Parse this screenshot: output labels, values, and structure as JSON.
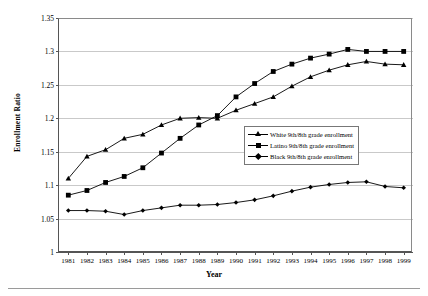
{
  "chart_data": {
    "type": "line",
    "title": "",
    "xlabel": "Year",
    "ylabel": "Enrollment Ratio",
    "x": [
      1981,
      1982,
      1983,
      1984,
      1985,
      1986,
      1987,
      1988,
      1989,
      1990,
      1991,
      1992,
      1993,
      1994,
      1995,
      1996,
      1997,
      1998,
      1999
    ],
    "categories": [
      "1981",
      "1982",
      "1983",
      "1984",
      "1985",
      "1986",
      "1987",
      "1988",
      "1989",
      "1990",
      "1991",
      "1992",
      "1993",
      "1994",
      "1995",
      "1996",
      "1997",
      "1998",
      "1999"
    ],
    "ylim": [
      1,
      1.35
    ],
    "ytick_labels": [
      "1",
      "1.05",
      "1.1",
      "1.15",
      "1.2",
      "1.25",
      "1.3",
      "1.35"
    ],
    "ytick_values": [
      1,
      1.05,
      1.1,
      1.15,
      1.2,
      1.25,
      1.3,
      1.35
    ],
    "grid": true,
    "legend_position": "center-right",
    "series": [
      {
        "name": "White 9th/8th grade enrollment",
        "marker": "triangle",
        "values": [
          1.11,
          1.143,
          1.153,
          1.17,
          1.176,
          1.19,
          1.2,
          1.201,
          1.2,
          1.212,
          1.222,
          1.232,
          1.248,
          1.262,
          1.272,
          1.28,
          1.285,
          1.281,
          1.28
        ]
      },
      {
        "name": "Latino 9th/8th grade enrollment",
        "marker": "square",
        "values": [
          1.085,
          1.092,
          1.104,
          1.113,
          1.126,
          1.148,
          1.17,
          1.19,
          1.204,
          1.232,
          1.252,
          1.27,
          1.281,
          1.29,
          1.296,
          1.303,
          1.3,
          1.3,
          1.3
        ]
      },
      {
        "name": "Black 9th/8th grade enrollment",
        "marker": "diamond",
        "values": [
          1.062,
          1.062,
          1.061,
          1.056,
          1.062,
          1.066,
          1.07,
          1.07,
          1.071,
          1.074,
          1.078,
          1.084,
          1.091,
          1.097,
          1.101,
          1.104,
          1.105,
          1.098,
          1.096
        ]
      }
    ]
  },
  "axes": {
    "x_title": "Year",
    "y_title": "Enrollment Ratio"
  }
}
